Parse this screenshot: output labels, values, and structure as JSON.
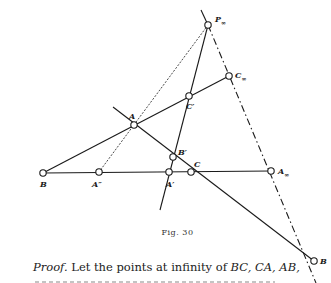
{
  "figure": {
    "caption": "Fig. 30",
    "points": [
      {
        "id": "P_inf",
        "label": "P",
        "sub": "∞",
        "x": 208,
        "y": 25,
        "lx": 215,
        "ly": 15
      },
      {
        "id": "C_inf",
        "label": "C",
        "sub": "∞",
        "x": 229,
        "y": 76,
        "lx": 235,
        "ly": 71
      },
      {
        "id": "C_prime",
        "label": "C′",
        "sub": "",
        "x": 189,
        "y": 96,
        "lx": 186,
        "ly": 102
      },
      {
        "id": "A",
        "label": "A",
        "sub": "",
        "x": 134,
        "y": 125,
        "lx": 129,
        "ly": 112
      },
      {
        "id": "B_prime",
        "label": "B′",
        "sub": "",
        "x": 173,
        "y": 157,
        "lx": 178,
        "ly": 148
      },
      {
        "id": "B",
        "label": "B",
        "sub": "",
        "x": 43,
        "y": 173,
        "lx": 40,
        "ly": 180
      },
      {
        "id": "A_dprime",
        "label": "A″",
        "sub": "",
        "x": 99,
        "y": 172,
        "lx": 92,
        "ly": 180
      },
      {
        "id": "A_prime",
        "label": "A′",
        "sub": "",
        "x": 169,
        "y": 172,
        "lx": 166,
        "ly": 180
      },
      {
        "id": "C",
        "label": "C",
        "sub": "",
        "x": 191,
        "y": 172,
        "lx": 194,
        "ly": 160
      },
      {
        "id": "A_inf",
        "label": "A",
        "sub": "∞",
        "x": 271,
        "y": 171,
        "lx": 278,
        "ly": 167
      },
      {
        "id": "B_inf",
        "label": "B",
        "sub": "",
        "x": 314,
        "y": 261,
        "lx": 320,
        "ly": 257
      }
    ]
  },
  "text": {
    "proof_label": "Proof.",
    "proof_body_1": "Let the points at infinity of ",
    "proof_math": "BC, CA, AB,"
  }
}
